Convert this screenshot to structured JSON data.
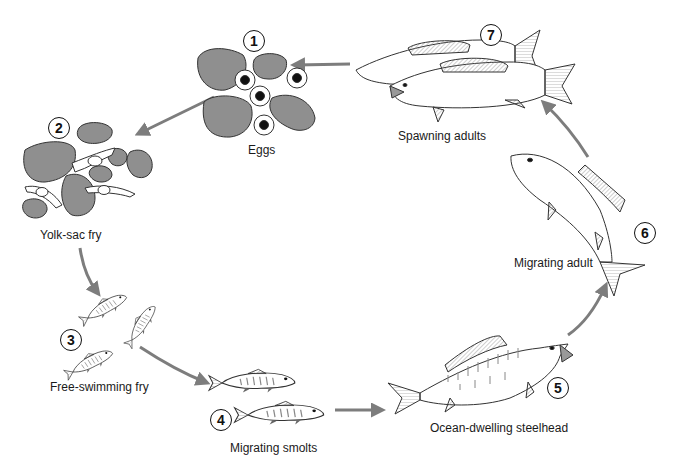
{
  "diagram": {
    "type": "life-cycle",
    "colors": {
      "arrow": "#7d7d7d",
      "rock": "#8f8f8f",
      "outline": "#2b2b2b",
      "egg_yolk": "#111111",
      "fin_hatch": "#9a9a9a"
    },
    "stages": [
      {
        "number": "1",
        "label": "Eggs"
      },
      {
        "number": "2",
        "label": "Yolk-sac fry"
      },
      {
        "number": "3",
        "label": "Free-swimming fry"
      },
      {
        "number": "4",
        "label": "Migrating smolts"
      },
      {
        "number": "5",
        "label": "Ocean-dwelling steelhead"
      },
      {
        "number": "6",
        "label": "Migrating adult"
      },
      {
        "number": "7",
        "label": "Spawning adults"
      }
    ],
    "flow": [
      "7→1",
      "1→2",
      "2→3",
      "3→4",
      "4→5",
      "5→6",
      "6→7"
    ]
  }
}
